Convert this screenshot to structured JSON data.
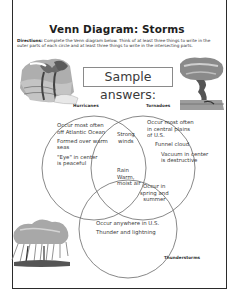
{
  "worksheet": {
    "title": "Venn Diagram: Storms",
    "directions_label": "Directions:",
    "directions_text": "Complete the Venn diagram below. Think of at least three things to write in the outer parts of each circle and at least three things to write in the intersecting parts.",
    "sample_heading": "Sample answers:"
  },
  "circles": {
    "hurricanes": {
      "label": "Hurricanes",
      "items": [
        "Occur most often",
        "off Atlantic Ocean",
        "Formed over warm",
        "seas",
        "\"Eye\" in center",
        "is peaceful"
      ]
    },
    "tornadoes": {
      "label": "Tornadoes",
      "items": [
        "Occur most often",
        "in central plains",
        "of U.S.",
        "Funnel cloud",
        "Vacuum in center",
        "is destructive"
      ]
    },
    "thunderstorms": {
      "label": "Thunderstorms",
      "items": [
        "Occur anywhere in U.S.",
        "Thunder and lightning"
      ]
    }
  },
  "overlaps": {
    "hurricanes_tornadoes": [
      "Strong",
      "winds"
    ],
    "all_three": [
      "Rain",
      "Warm,",
      "moist air"
    ],
    "tornadoes_thunderstorms": [
      "Occur in",
      "spring and",
      "summer"
    ]
  },
  "illustrations": {
    "hurricane": "hurricane-illustration",
    "tornado": "tornado-illustration",
    "thunderstorm": "thunderstorm-illustration"
  },
  "colors": {
    "border": "#2b2b2b",
    "circle_stroke": "#6a6a6a",
    "text": "#3a3a3a"
  }
}
